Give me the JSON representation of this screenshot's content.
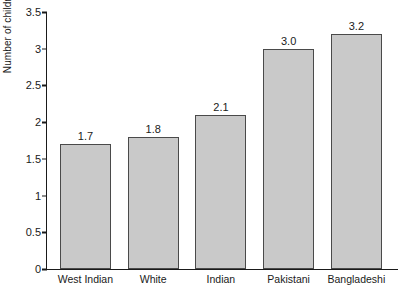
{
  "chart_data": {
    "type": "bar",
    "title": "",
    "xlabel": "",
    "ylabel": "Number of children",
    "categories": [
      "West Indian",
      "White",
      "Indian",
      "Pakistani",
      "Bangladeshi"
    ],
    "values": [
      1.7,
      1.8,
      2.1,
      3.0,
      3.2
    ],
    "data_labels": [
      "1.7",
      "1.8",
      "2.1",
      "3.0",
      "3.2"
    ],
    "ylim": [
      0,
      3.5
    ],
    "ytick_labels": [
      "0",
      "0.5",
      "1",
      "1.5",
      "2",
      "2.5",
      "3",
      "3.5"
    ],
    "ytick_values": [
      0,
      0.5,
      1,
      1.5,
      2,
      2.5,
      3,
      3.5
    ],
    "grid": false,
    "legend": "none",
    "bar_color": "#c9c9c9",
    "bar_border_color": "#4a4a4a",
    "axis_color": "#1a1a1a"
  }
}
